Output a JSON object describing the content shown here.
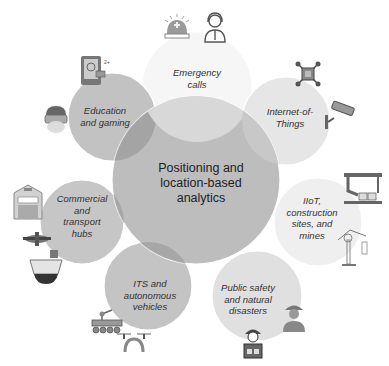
{
  "center": {
    "lines": [
      "Positioning and",
      "location-based",
      "analytics"
    ]
  },
  "nodes": [
    {
      "id": "emergency",
      "lines": [
        "Emergency",
        "calls"
      ],
      "icons": [
        "siren-icon",
        "call-operator-icon"
      ]
    },
    {
      "id": "iot",
      "lines": [
        "Internet-of-",
        "Things"
      ],
      "icons": [
        "drone-sensor-icon",
        "security-camera-icon"
      ]
    },
    {
      "id": "iiot",
      "lines": [
        "IIoT,",
        "construction",
        "sites, and",
        "mines"
      ],
      "icons": [
        "robotic-assembly-line-icon",
        "tower-crane-icon"
      ]
    },
    {
      "id": "public-safety",
      "lines": [
        "Public safety",
        "and natural",
        "disasters"
      ],
      "icons": [
        "police-officer-icon",
        "firefighter-icon"
      ]
    },
    {
      "id": "its",
      "lines": [
        "ITS and",
        "autonomous",
        "vehicles"
      ],
      "icons": [
        "robot-rover-icon",
        "quadcopter-drone-icon"
      ]
    },
    {
      "id": "commercial",
      "lines": [
        "Commercial",
        "and",
        "transport",
        "hubs"
      ],
      "icons": [
        "warehouse-icon",
        "airplane-icon",
        "cargo-ship-icon"
      ]
    },
    {
      "id": "education",
      "lines": [
        "Education",
        "and gaming"
      ],
      "icons": [
        "tablet-app-icon",
        "vr-headset-icon"
      ]
    }
  ],
  "colors": {
    "center": "#b9b9b9",
    "emergency": "#f6f6f6",
    "iot": "#e4e4e4",
    "iiot": "#efefef",
    "public_safety": "#dedede",
    "its": "#c4c4c4",
    "commercial": "#c6c6c6",
    "education": "#c2c2c2",
    "overlap": "#a5a5a5"
  }
}
